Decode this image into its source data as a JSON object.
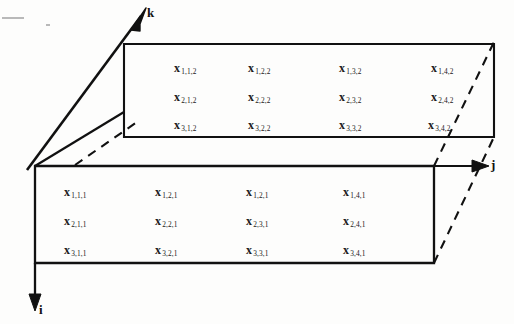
{
  "figure": {
    "background_color": "#fdfdfc",
    "line_color": "#111111"
  },
  "axes": [
    {
      "name": "i",
      "label": "i",
      "direction": "down",
      "description": "row index axis pointing downward along left edge"
    },
    {
      "name": "j",
      "label": "j",
      "direction": "right",
      "description": "column index axis pointing right along top of front face"
    },
    {
      "name": "k",
      "label": "k",
      "direction": "up-right",
      "description": "depth index axis pointing diagonally up and to the right"
    }
  ],
  "faces": {
    "back": {
      "name": "k-equals-2-slice",
      "rows": [
        [
          "x",
          "1,1,2",
          "x",
          "1,2,2",
          "x",
          "1,3,2",
          "x",
          "1,4,2"
        ],
        [
          "x",
          "2,1,2",
          "x",
          "2,2,2",
          "x",
          "2,3,2",
          "x",
          "2,4,2"
        ],
        [
          "x",
          "3,1,2",
          "x",
          "3,2,2",
          "x",
          "3,3,2",
          "x",
          "3,4,2"
        ]
      ],
      "cells": [
        {
          "base": "x",
          "sub": "1,1,2"
        },
        {
          "base": "x",
          "sub": "1,2,2"
        },
        {
          "base": "x",
          "sub": "1,3,2"
        },
        {
          "base": "x",
          "sub": "1,4,2"
        },
        {
          "base": "x",
          "sub": "2,1,2"
        },
        {
          "base": "x",
          "sub": "2,2,2"
        },
        {
          "base": "x",
          "sub": "2,3,2"
        },
        {
          "base": "x",
          "sub": "2,4,2"
        },
        {
          "base": "x",
          "sub": "3,1,2"
        },
        {
          "base": "x",
          "sub": "3,2,2"
        },
        {
          "base": "x",
          "sub": "3,3,2"
        },
        {
          "base": "x",
          "sub": "3,4,2"
        }
      ]
    },
    "front": {
      "name": "k-equals-1-slice",
      "rows": [
        [
          "x",
          "1,1,1",
          "x",
          "1,2,1",
          "x",
          "1,2,1",
          "x",
          "1,4,1"
        ],
        [
          "x",
          "2,1,1",
          "x",
          "2,2,1",
          "x",
          "2,3,1",
          "x",
          "2,4,1"
        ],
        [
          "x",
          "3,1,1",
          "x",
          "3,2,1",
          "x",
          "3,3,1",
          "x",
          "3,4,1"
        ]
      ],
      "cells": [
        {
          "base": "x",
          "sub": "1,1,1"
        },
        {
          "base": "x",
          "sub": "1,2,1"
        },
        {
          "base": "x",
          "sub": "1,2,1"
        },
        {
          "base": "x",
          "sub": "1,4,1"
        },
        {
          "base": "x",
          "sub": "2,1,1"
        },
        {
          "base": "x",
          "sub": "2,2,1"
        },
        {
          "base": "x",
          "sub": "2,3,1"
        },
        {
          "base": "x",
          "sub": "2,4,1"
        },
        {
          "base": "x",
          "sub": "3,1,1"
        },
        {
          "base": "x",
          "sub": "3,2,1"
        },
        {
          "base": "x",
          "sub": "3,3,1"
        },
        {
          "base": "x",
          "sub": "3,4,1"
        }
      ]
    }
  }
}
